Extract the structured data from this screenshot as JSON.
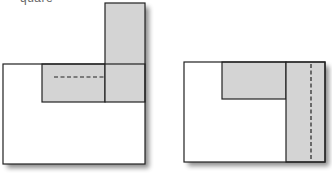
{
  "caption_fragment": "quare",
  "colors": {
    "stroke": "#222222",
    "shaded": "#d4d4d4",
    "background": "#ffffff",
    "shadow": "#9a9a9a"
  },
  "figures": [
    {
      "name": "left-figure",
      "description": "Square with an L-shaped gray strip; top-right strip rotated upward with horizontal dashed fold line",
      "outer_rect": {
        "x": 3,
        "y": 64,
        "w": 142,
        "h": 100
      },
      "shaded_horizontal": {
        "x": 42,
        "y": 64,
        "w": 63,
        "h": 38
      },
      "shaded_vertical": {
        "x": 105,
        "y": 3,
        "w": 40,
        "h": 99
      },
      "dashed_line": {
        "x1": 54,
        "y1": 77,
        "x2": 104,
        "y2": 77
      }
    },
    {
      "name": "right-figure",
      "description": "Rectangle with gray top strip and gray right strip containing vertical dashed fold line",
      "outer_rect": {
        "x": 184,
        "y": 62,
        "w": 141,
        "h": 100
      },
      "shaded_horizontal": {
        "x": 222,
        "y": 62,
        "w": 64,
        "h": 37
      },
      "shaded_vertical": {
        "x": 286,
        "y": 62,
        "w": 39,
        "h": 100
      },
      "dashed_line": {
        "x1": 311,
        "y1": 64,
        "x2": 311,
        "y2": 161
      }
    }
  ]
}
